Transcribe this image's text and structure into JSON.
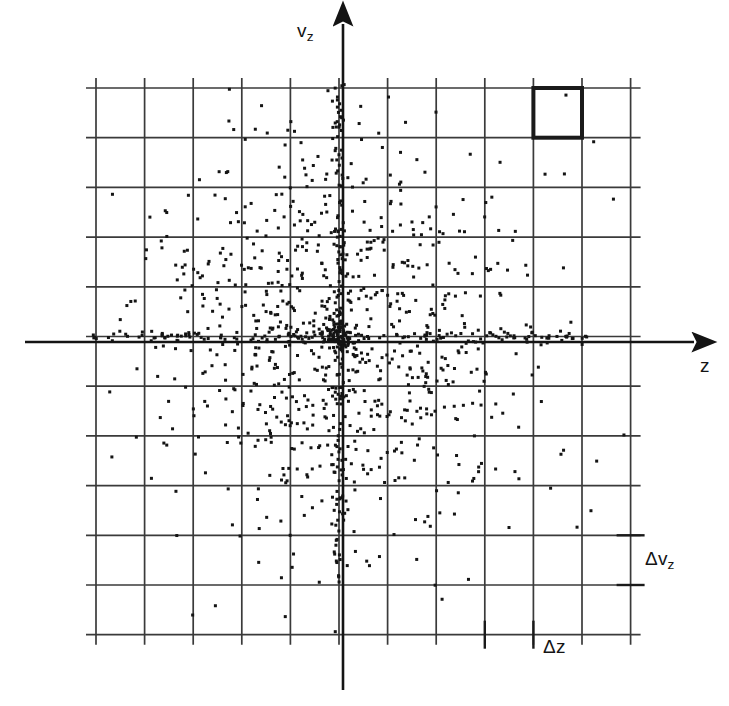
{
  "figure": {
    "kind": "phase-space-scatter",
    "background_color": "#ffffff",
    "ink_color": "#1a1a1a",
    "grid_color": "#3a3a3a"
  },
  "labels": {
    "y_axis": "v",
    "y_axis_sub": "z",
    "x_axis": "z",
    "cell_height": "Δv",
    "cell_height_sub": "z",
    "cell_width": "Δz"
  },
  "chart_data": {
    "type": "scatter",
    "title": "",
    "xlabel": "z",
    "ylabel": "v_z",
    "grid": true,
    "legend": false,
    "xlim": [
      -5.5,
      5.5
    ],
    "ylim": [
      -5.5,
      5.5
    ],
    "grid_columns": 11,
    "grid_rows": 11,
    "cell_width_label": "Δz",
    "cell_height_label": "Δv_z",
    "origin_cell": [
      5,
      5
    ],
    "highlighted_cell": {
      "column": 9,
      "row": 1,
      "x_range": [
        3.0,
        4.0
      ],
      "y_range": [
        4.0,
        5.0
      ],
      "stroke_width_px": 4
    },
    "point_count": 1180,
    "distribution": {
      "radial_profile": "centrally peaked, density falls off with radius from origin",
      "axis_concentration": "enhanced density along the z = 0 and v_z = 0 axes",
      "core_cluster": "dense knot of points at the origin",
      "outer_cells": "nearly empty near the grid border"
    },
    "marker": {
      "shape": "square",
      "size_px": 3,
      "color": "#141414"
    },
    "axes_style": {
      "x_axis_extent_px": [
        25,
        700
      ],
      "y_axis_extent_px": [
        18,
        690
      ],
      "arrowheads": [
        "x-positive",
        "y-positive"
      ]
    }
  }
}
